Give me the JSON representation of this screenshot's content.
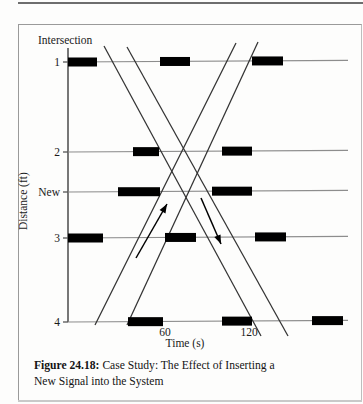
{
  "figure": {
    "number": "Figure 24.18:",
    "caption_line1": " Case Study: The Effect of Inserting a",
    "caption_line2": "New Signal into the System",
    "full_caption": "Figure 24.18: Case Study: The Effect of Inserting a New Signal into the System"
  },
  "axes": {
    "y_title": "Distance (ft)",
    "x_title": "Time (s)",
    "corner_label": "Intersection",
    "y_ticks": [
      {
        "label": "1",
        "y": 62
      },
      {
        "label": "2",
        "y": 152
      },
      {
        "label": "New",
        "y": 192
      },
      {
        "label": "3",
        "y": 238
      },
      {
        "label": "4",
        "y": 322
      }
    ],
    "x_ticks": [
      {
        "label": "60",
        "x": 165
      },
      {
        "label": "120",
        "x": 249
      }
    ],
    "x_range": [
      0,
      180
    ],
    "y_axis_x": 68,
    "plot_right": 348
  },
  "chart_data": {
    "type": "diagram",
    "title": "Case Study: The Effect of Inserting a New Signal into the System",
    "xlabel": "Time (s)",
    "ylabel": "Distance (ft)",
    "corner_label": "Intersection",
    "x_ticks": [
      60,
      120
    ],
    "y_tick_labels": [
      "1",
      "2",
      "New",
      "3",
      "4"
    ],
    "rows": [
      {
        "label": "1",
        "y": 62,
        "bars": [
          {
            "x1": 68,
            "x2": 97
          },
          {
            "x1": 160,
            "x2": 190
          },
          {
            "x1": 252,
            "x2": 283
          }
        ]
      },
      {
        "label": "2",
        "y": 152,
        "bars": [
          {
            "x1": 133,
            "x2": 159
          },
          {
            "x1": 222,
            "x2": 252
          }
        ]
      },
      {
        "label": "New",
        "y": 192,
        "bars": [
          {
            "x1": 118,
            "x2": 160
          },
          {
            "x1": 212,
            "x2": 252
          }
        ]
      },
      {
        "label": "3",
        "y": 238,
        "bars": [
          {
            "x1": 68,
            "x2": 103
          },
          {
            "x1": 165,
            "x2": 196
          },
          {
            "x1": 255,
            "x2": 286
          }
        ]
      },
      {
        "label": "4",
        "y": 322,
        "bars": [
          {
            "x1": 128,
            "x2": 163
          },
          {
            "x1": 222,
            "x2": 252
          },
          {
            "x1": 312,
            "x2": 343
          }
        ]
      }
    ],
    "trajectories": [
      {
        "name": "downbound-1",
        "direction": "descending",
        "x1": 104,
        "y1": 46,
        "x2": 261,
        "y2": 336
      },
      {
        "name": "downbound-2",
        "direction": "descending",
        "x1": 127,
        "y1": 47,
        "x2": 288,
        "y2": 336
      },
      {
        "name": "upbound-1",
        "direction": "ascending",
        "x1": 95,
        "y1": 325,
        "x2": 236,
        "y2": 43
      },
      {
        "name": "upbound-2",
        "direction": "ascending",
        "x1": 127,
        "y1": 325,
        "x2": 258,
        "y2": 42
      }
    ],
    "arrows": [
      {
        "name": "upbound-direction-arrow",
        "x1": 136,
        "y1": 258,
        "x2": 167,
        "y2": 204,
        "head": "up-right"
      },
      {
        "name": "downbound-direction-arrow",
        "x1": 201,
        "y1": 198,
        "x2": 221,
        "y2": 244,
        "head": "down-right"
      }
    ],
    "bar_color": "#000000",
    "line_color": "#333333",
    "grid_color": "#8d8d8d"
  }
}
